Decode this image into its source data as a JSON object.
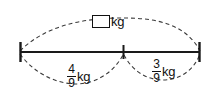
{
  "diagram": {
    "type": "number-line-part-whole-model",
    "line": {
      "start_x": 20,
      "end_x": 200,
      "y": 52,
      "mid_tick_x": 123
    },
    "total_label": {
      "value": "",
      "placeholder_box": "empty-answer-box",
      "unit": "kg"
    },
    "parts": [
      {
        "id": "left-part",
        "numerator": "4",
        "denominator": "9",
        "unit": "kg",
        "span": "start-to-middle"
      },
      {
        "id": "right-part",
        "numerator": "3",
        "denominator": "9",
        "unit": "kg",
        "span": "middle-to-end"
      }
    ],
    "colors": {
      "line": "#1a1a1a",
      "dashed_arc": "#3a3a3a",
      "text": "#111111",
      "background": "#ffffff"
    }
  }
}
